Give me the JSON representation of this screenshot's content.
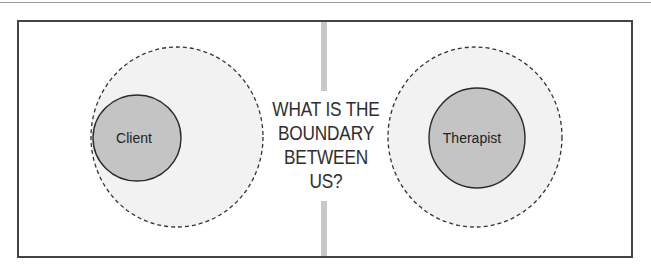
{
  "diagram": {
    "question_lines": [
      "WHAT IS THE",
      "BOUNDARY",
      "BETWEEN",
      "US?"
    ],
    "left": {
      "label": "Client",
      "inner_fill": "#c4c4c4",
      "outer_fill": "#f2f2f2",
      "outer_border": "dashed"
    },
    "right": {
      "label": "Therapist",
      "inner_fill": "#c4c4c4",
      "outer_fill": "#f2f2f2",
      "outer_border": "dashed"
    },
    "colors": {
      "frame_border": "#444444",
      "divider": "#c8c8c8",
      "text": "#222222"
    }
  }
}
